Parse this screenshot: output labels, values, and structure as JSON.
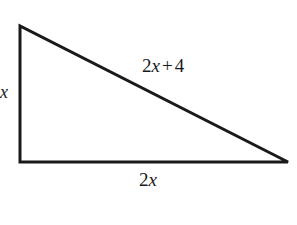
{
  "figure": {
    "type": "right-triangle-diagram",
    "background_color": "#ffffff",
    "stroke_color": "#1a1a1a",
    "stroke_width": 3,
    "vertices": {
      "top_left": [
        20,
        26
      ],
      "bottom_left": [
        20,
        162
      ],
      "bottom_right": [
        288,
        162
      ]
    },
    "labels": {
      "left_leg": "x",
      "hypotenuse_coefficient": "2",
      "hypotenuse_variable": "x",
      "hypotenuse_operator": "+",
      "hypotenuse_constant": "4",
      "base_coefficient": "2",
      "base_variable": "x",
      "hypotenuse_full": "2x + 4",
      "base_full": "2x"
    }
  }
}
